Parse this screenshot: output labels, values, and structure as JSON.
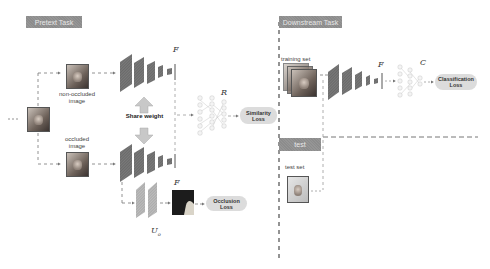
{
  "pretext": {
    "tag": "Pretext Task",
    "non_occluded_label_line1": "non-occluded",
    "non_occluded_label_line2": "image",
    "occluded_label_line1": "occluded",
    "occluded_label_line2": "image",
    "share_weight": "Share weight",
    "encoder_symbol_top": "F",
    "encoder_symbol_bottom": "F",
    "projection_symbol": "R",
    "decoder_symbol": "U",
    "decoder_subscript": "o",
    "similarity_loss_line1": "Similarity",
    "similarity_loss_line2": "Loss",
    "occlusion_loss_line1": "Occlusion",
    "occlusion_loss_line2": "Loss"
  },
  "downstream": {
    "tag": "Downstream Task",
    "training_set_label": "training set",
    "encoder_symbol": "F",
    "classifier_symbol": "C",
    "classification_loss_line1": "Classification",
    "classification_loss_line2": "Loss",
    "test_tag": "test",
    "test_set_label": "test set"
  },
  "colors": {
    "tag_bg": "#8c8c8c",
    "layer_dark": "#6f6f6f",
    "layer_light": "#b5b5b5",
    "loss_bg": "#dcdcdc",
    "arrow_fill": "#c8c8c8",
    "dashed_line": "#777777"
  }
}
